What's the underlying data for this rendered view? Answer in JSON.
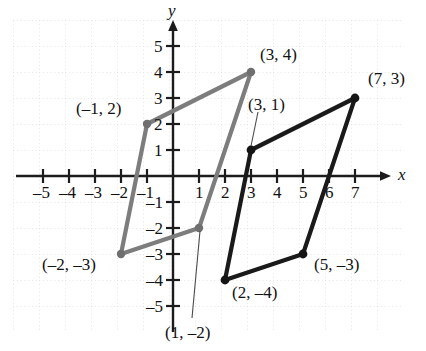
{
  "figure": {
    "type": "coordinate-plane",
    "axes": {
      "x_label": "x",
      "y_label": "y",
      "x_ticks": [
        -5,
        -4,
        -3,
        -2,
        -1,
        1,
        2,
        3,
        4,
        5,
        6,
        7
      ],
      "y_ticks": [
        5,
        4,
        3,
        2,
        1,
        -1,
        -2,
        -3,
        -4,
        -5
      ],
      "x_tick_labels": [
        "–5",
        "–4",
        "–3",
        "–2",
        "–1",
        "1",
        "2",
        "3",
        "4",
        "5",
        "6",
        "7"
      ],
      "y_tick_labels": [
        "5",
        "4",
        "3",
        "2",
        "1",
        "–1",
        "–2",
        "–3",
        "–4",
        "–5"
      ],
      "xlim": [
        -6,
        7.8
      ],
      "ylim": [
        -5.9,
        5.6
      ],
      "grid": "dotted",
      "grid_color": "#d8d8d8",
      "axis_color": "#1c1c1c"
    },
    "shapes": [
      {
        "name": "original-parallelogram",
        "color": "#7d7d7d",
        "vertices": [
          {
            "x": -1,
            "y": 2,
            "label": "(–1, 2)"
          },
          {
            "x": 3,
            "y": 4,
            "label": "(3, 4)"
          },
          {
            "x": 1,
            "y": -2,
            "label": "(1, –2)"
          },
          {
            "x": -2,
            "y": -3,
            "label": "(–2, –3)"
          }
        ]
      },
      {
        "name": "translated-parallelogram",
        "color": "#1a1a1a",
        "vertices": [
          {
            "x": 3,
            "y": 1,
            "label": "(3, 1)"
          },
          {
            "x": 7,
            "y": 3,
            "label": "(7, 3)"
          },
          {
            "x": 5,
            "y": -3,
            "label": "(5, –3)"
          },
          {
            "x": 2,
            "y": -4,
            "label": "(2, –4)"
          }
        ]
      }
    ],
    "labels": [
      {
        "name": "label-neg1-2",
        "text": "(–1, 2)",
        "x": 76,
        "y": 100
      },
      {
        "name": "label-3-4",
        "text": "(3, 4)",
        "x": 260,
        "y": 46
      },
      {
        "name": "label-7-3",
        "text": "(7, 3)",
        "x": 370,
        "y": 70
      },
      {
        "name": "label-3-1",
        "text": "(3, 1)",
        "x": 246,
        "y": 96
      },
      {
        "name": "label-neg2-neg3",
        "text": "(–2, –3)",
        "x": 42,
        "y": 254
      },
      {
        "name": "label-5-neg3",
        "text": "(5, –3)",
        "x": 314,
        "y": 255
      },
      {
        "name": "label-2-neg4",
        "text": "(2, –4)",
        "x": 232,
        "y": 284
      },
      {
        "name": "label-1-neg2",
        "text": "(1, –2)",
        "x": 165,
        "y": 326
      }
    ],
    "leader_lines": [
      {
        "name": "leader-3-1",
        "x1": 258,
        "y1": 111,
        "x2": 251,
        "y2": 145
      },
      {
        "name": "leader-1-neg2",
        "x1": 203,
        "y1": 228,
        "x2": 193,
        "y2": 318
      }
    ]
  }
}
